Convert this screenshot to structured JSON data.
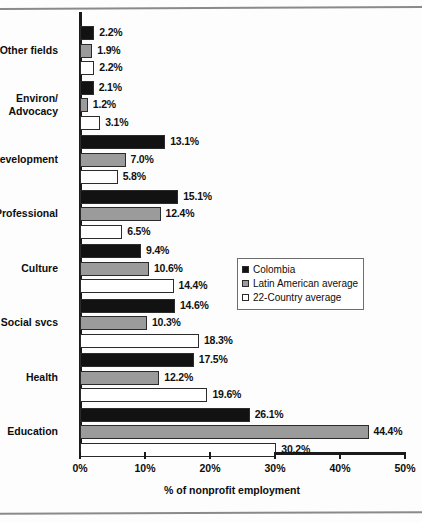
{
  "chart_data": {
    "type": "bar",
    "orientation": "horizontal",
    "title": "",
    "xlabel": "% of nonprofit employment",
    "ylabel": "",
    "xlim": [
      0,
      50
    ],
    "xticks": [
      "0%",
      "10%",
      "20%",
      "30%",
      "40%",
      "50%"
    ],
    "xtick_values": [
      0,
      10,
      20,
      30,
      40,
      50
    ],
    "grid": false,
    "legend_position": "center-right",
    "categories": [
      "Other fields",
      "Environ/\nAdvocacy",
      "Development",
      "Professional",
      "Culture",
      "Social svcs",
      "Health",
      "Education"
    ],
    "series": [
      {
        "name": "Colombia",
        "color": "#121212",
        "values": [
          2.2,
          2.1,
          13.1,
          15.1,
          9.4,
          14.6,
          17.5,
          26.1
        ],
        "labels": [
          "2.2%",
          "2.1%",
          "13.1%",
          "15.1%",
          "9.4%",
          "14.6%",
          "17.5%",
          "26.1%"
        ]
      },
      {
        "name": "Latin American average",
        "color": "#9b9b9b",
        "values": [
          1.9,
          1.2,
          7.0,
          12.4,
          10.6,
          10.3,
          12.2,
          44.4
        ],
        "labels": [
          "1.9%",
          "1.2%",
          "7.0%",
          "12.4%",
          "10.6%",
          "10.3%",
          "12.2%",
          "44.4%"
        ]
      },
      {
        "name": "22-Country average",
        "color": "#ffffff",
        "values": [
          2.2,
          3.1,
          5.8,
          6.5,
          14.4,
          18.3,
          19.6,
          30.2
        ],
        "labels": [
          "2.2%",
          "3.1%",
          "5.8%",
          "6.5%",
          "14.4%",
          "18.3%",
          "19.6%",
          "30.2%"
        ]
      }
    ]
  },
  "legend": {
    "items": [
      {
        "label": "Colombia"
      },
      {
        "label": "Latin American average"
      },
      {
        "label": "22-Country average"
      }
    ]
  },
  "axis": {
    "x_title": "% of nonprofit employment"
  }
}
